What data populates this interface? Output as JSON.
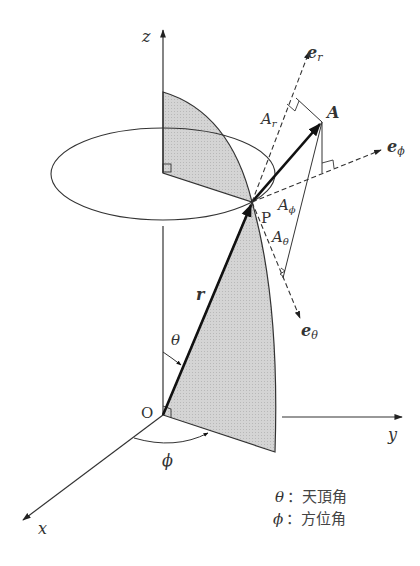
{
  "diagram": {
    "type": "spherical-coordinates",
    "axes": {
      "x": "x",
      "y": "y",
      "z": "z",
      "origin": "O"
    },
    "point": "P",
    "position_vector": "r",
    "vector": "A",
    "unit_vectors": {
      "e_r": {
        "base": "e",
        "sub": "r"
      },
      "e_phi": {
        "base": "e",
        "sub": "ϕ"
      },
      "e_theta": {
        "base": "e",
        "sub": "θ"
      }
    },
    "components": {
      "A_r": {
        "base": "A",
        "sub": "r"
      },
      "A_phi": {
        "base": "A",
        "sub": "ϕ"
      },
      "A_theta": {
        "base": "A",
        "sub": "θ"
      }
    },
    "angles": {
      "theta": "θ",
      "phi": "ϕ"
    },
    "legend": [
      {
        "symbol": "θ",
        "sep": "：",
        "text": "天頂角"
      },
      {
        "symbol": "ϕ",
        "sep": "：",
        "text": "方位角"
      }
    ],
    "colors": {
      "line": "#333333",
      "shade": "#cfcfcf",
      "background": "#ffffff"
    }
  }
}
